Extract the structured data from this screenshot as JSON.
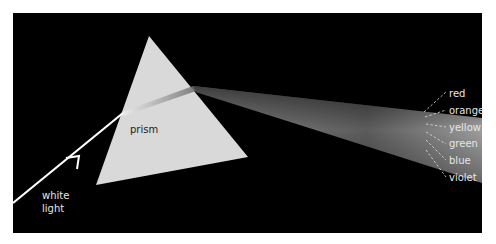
{
  "diagram": {
    "title": "",
    "prism_label": "prism",
    "incoming_label_line1": "white",
    "incoming_label_line2": "light",
    "spectrum_labels": [
      "red",
      "orange",
      "yellow",
      "green",
      "blue",
      "violet"
    ],
    "colors": {
      "background": "#000000",
      "prism_fill": "#d9d9d9",
      "beam": "#ffffff",
      "label_text": "#e6e6e6",
      "prism_label_text": "#222222"
    }
  }
}
